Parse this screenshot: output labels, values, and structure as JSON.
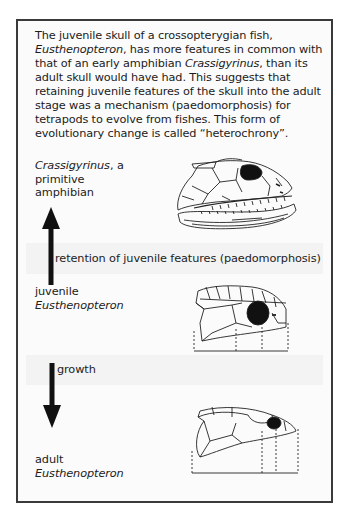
{
  "intro": {
    "segments": [
      {
        "text": "The juvenile skull of a crossopterygian fish, ",
        "italic": false
      },
      {
        "text": "Eusthenopteron",
        "italic": true
      },
      {
        "text": ", has more features in common with that of an early amphibian ",
        "italic": false
      },
      {
        "text": "Crassigyrinus",
        "italic": true
      },
      {
        "text": ", than its adult skull would have had. This suggests that retaining juvenile features of the skull into the adult stage was a mechanism (paedomorphosis) for tetrapods to evolve from fishes. This form of evolutionary change is called “heterochrony”.",
        "italic": false
      }
    ]
  },
  "diagram": {
    "crassigyrinus": {
      "name": "Crassigyrinus",
      "suffix": ", a",
      "line2": "primitive",
      "line3": "amphibian"
    },
    "paedomorphosis_label": "retention of juvenile features (paedomorphosis)",
    "juvenile": {
      "stage": "juvenile",
      "name": "Eusthenopteron"
    },
    "growth_label": "growth",
    "adult": {
      "stage": "adult",
      "name": "Eusthenopteron"
    },
    "arrows": [
      {
        "direction": "up",
        "meaning": "evolution toward amphibian via paedomorphosis"
      },
      {
        "direction": "down",
        "meaning": "growth from juvenile to adult"
      }
    ],
    "colors": {
      "frame": "#3a3a3a",
      "ink": "#111111",
      "band": "#f3f3f3"
    }
  }
}
